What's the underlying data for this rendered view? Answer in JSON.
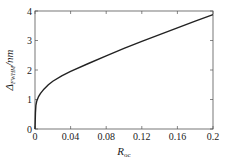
{
  "chart_data": {
    "type": "line",
    "title": "",
    "xlabel": "R_oc",
    "xlabel_main": "R",
    "xlabel_sub": "oc",
    "ylabel": "Δ_FWHM/nm",
    "ylabel_main": "Δ",
    "ylabel_sub": "FWHM",
    "ylabel_unit": "/nm",
    "xlim": [
      0,
      0.2
    ],
    "ylim": [
      0,
      4
    ],
    "xticks": [
      0,
      0.04,
      0.08,
      0.12,
      0.16,
      0.2
    ],
    "xtick_labels": [
      "0",
      "0.04",
      "0.08",
      "0.12",
      "0.16",
      "0.2"
    ],
    "yticks": [
      0,
      1,
      2,
      3,
      4
    ],
    "ytick_labels": [
      "0",
      "1",
      "2",
      "3",
      "4"
    ],
    "grid": false,
    "legend": null,
    "series": [
      {
        "name": "Δ_FWHM",
        "color": "#222222",
        "x": [
          0,
          0.0005,
          0.001,
          0.002,
          0.004,
          0.006,
          0.01,
          0.015,
          0.02,
          0.03,
          0.04,
          0.06,
          0.08,
          0.1,
          0.12,
          0.14,
          0.16,
          0.18,
          0.2
        ],
        "y": [
          0,
          0.55,
          0.8,
          0.95,
          1.1,
          1.2,
          1.35,
          1.5,
          1.62,
          1.8,
          1.95,
          2.22,
          2.48,
          2.73,
          2.97,
          3.2,
          3.43,
          3.66,
          3.88
        ]
      }
    ]
  }
}
